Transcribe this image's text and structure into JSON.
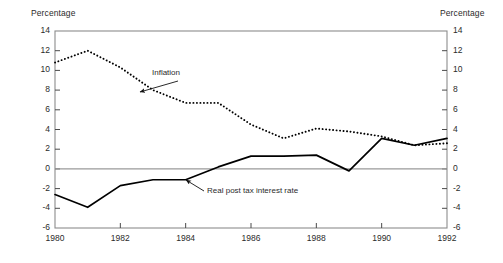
{
  "chart_data": {
    "type": "line",
    "title": "",
    "xlabel": "",
    "ylabel": "Percentage",
    "ylabel_right": "Percentage",
    "xlim": [
      1980,
      1992
    ],
    "ylim": [
      -6,
      14
    ],
    "grid": false,
    "legend_position": "inline-annotations",
    "x_ticks": [
      "1980",
      "1982",
      "1984",
      "1986",
      "1988",
      "1990",
      "1992"
    ],
    "x_tick_values": [
      1980,
      1982,
      1984,
      1986,
      1988,
      1990,
      1992
    ],
    "y_ticks": [
      "14",
      "12",
      "10",
      "8",
      "6",
      "4",
      "2",
      "0",
      "-2",
      "-4",
      "-6"
    ],
    "y_tick_values": [
      14,
      12,
      10,
      8,
      6,
      4,
      2,
      0,
      -2,
      -4,
      -6
    ],
    "x": [
      1980,
      1981,
      1982,
      1983,
      1984,
      1985,
      1986,
      1987,
      1988,
      1989,
      1990,
      1991,
      1992
    ],
    "series": [
      {
        "name": "Inflation",
        "style": "dotted",
        "color": "#000000",
        "values": [
          10.8,
          12.0,
          10.3,
          8.0,
          6.7,
          6.7,
          4.5,
          3.1,
          4.1,
          3.8,
          3.3,
          2.4,
          2.6
        ]
      },
      {
        "name": "Real post tax interest rate",
        "style": "solid",
        "color": "#000000",
        "values": [
          -2.6,
          -3.9,
          -1.7,
          -1.1,
          -1.1,
          0.2,
          1.3,
          1.3,
          1.4,
          -0.2,
          3.1,
          2.4,
          3.1
        ]
      }
    ],
    "annotations": [
      {
        "text": "Inflation",
        "label_x": 152,
        "label_y": 74,
        "arrow_from_x": 178,
        "arrow_from_y": 81,
        "arrow_to_x": 140,
        "arrow_to_y": 92
      },
      {
        "text": "Real post tax interest rate",
        "label_x": 207,
        "label_y": 192,
        "arrow_from_x": 204,
        "arrow_from_y": 191,
        "arrow_to_x": 186,
        "arrow_to_y": 180
      }
    ],
    "zero_line": 0
  }
}
